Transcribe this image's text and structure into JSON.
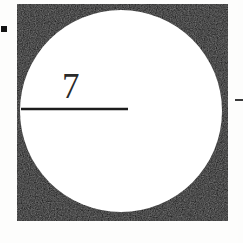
{
  "figure": {
    "background_color": "#fdfdfc",
    "square": {
      "name": "outer-square",
      "fill_color": "#111111",
      "x": 17,
      "y": 4,
      "width": 211,
      "height": 217
    },
    "circle": {
      "name": "inscribed-circle",
      "fill_color": "#ffffff",
      "center_x": 121,
      "center_y": 111,
      "radius": 101
    },
    "radius_segment": {
      "name": "radius-line",
      "stroke_color": "#1c1c1c",
      "stroke_width": 2.4,
      "x1": 21,
      "y1": 109,
      "x2": 128,
      "y2": 109
    },
    "labels": [
      {
        "name": "radius-length-label",
        "text": "7",
        "x": 62,
        "y": 69,
        "color": "#2a2a2a",
        "font_size": 35
      }
    ],
    "scan_marks": [
      {
        "name": "left-edge-scan-mark",
        "color": "#141414",
        "x": 1,
        "y": 26,
        "width": 6,
        "height": 6
      },
      {
        "name": "right-edge-scan-mark",
        "color": "#3a3a3a",
        "x": 235,
        "y": 99,
        "width": 8,
        "height": 2
      }
    ]
  }
}
